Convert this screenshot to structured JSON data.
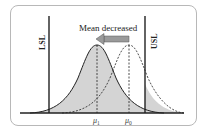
{
  "diagram": {
    "title_annotation": "Mean decreased",
    "lower_limit_label": "LSL",
    "upper_limit_label": "USL",
    "mean_new_label": "μ1",
    "mean_old_label": "μ0",
    "mean_new_base": "μ",
    "mean_new_sub": "1",
    "mean_old_base": "μ",
    "mean_old_sub": "0",
    "colors": {
      "shade": "#d4d4d4",
      "line": "#222222",
      "arrow_fill": "#9a9a9a",
      "frame": "#b8b8b8"
    }
  }
}
